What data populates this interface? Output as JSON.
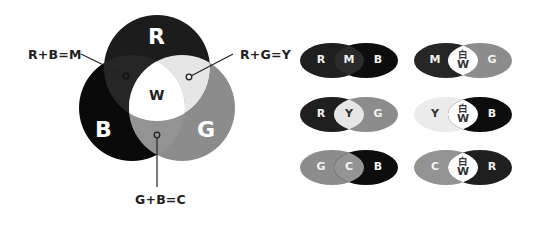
{
  "venn": {
    "circles": [
      {
        "label": "R",
        "color": "#1c1c1c"
      },
      {
        "label": "B",
        "color": "#0a0a0a"
      },
      {
        "label": "G",
        "color": "#8c8c8c"
      }
    ],
    "center_label": "W",
    "regions": {
      "M": "#262626",
      "Y": "#e6e6e6",
      "C": "#939393",
      "W": "#ffffff"
    },
    "callouts": {
      "rb": "R+B=M",
      "rg": "R+G=Y",
      "gb": "G+B=C"
    }
  },
  "pills": [
    {
      "left": "R",
      "mid": "M",
      "right": "B",
      "left_color": "#1f1f1f",
      "mid_color": "#2b2b2b",
      "right_color": "#0d0d0d"
    },
    {
      "left": "M",
      "mid": "白",
      "mid2": "W",
      "right": "G",
      "left_color": "#262626",
      "mid_color": "#ffffff",
      "right_color": "#8c8c8c"
    },
    {
      "left": "R",
      "mid": "Y",
      "right": "G",
      "left_color": "#1f1f1f",
      "mid_color": "#e6e6e6",
      "right_color": "#8c8c8c"
    },
    {
      "left": "Y",
      "mid": "白",
      "mid2": "W",
      "right": "B",
      "left_color": "#ebebeb",
      "mid_color": "#ffffff",
      "right_color": "#0d0d0d"
    },
    {
      "left": "G",
      "mid": "C",
      "right": "B",
      "left_color": "#8c8c8c",
      "mid_color": "#949494",
      "right_color": "#0d0d0d"
    },
    {
      "left": "C",
      "mid": "白",
      "mid2": "W",
      "right": "R",
      "left_color": "#939393",
      "mid_color": "#ffffff",
      "right_color": "#1f1f1f"
    }
  ]
}
